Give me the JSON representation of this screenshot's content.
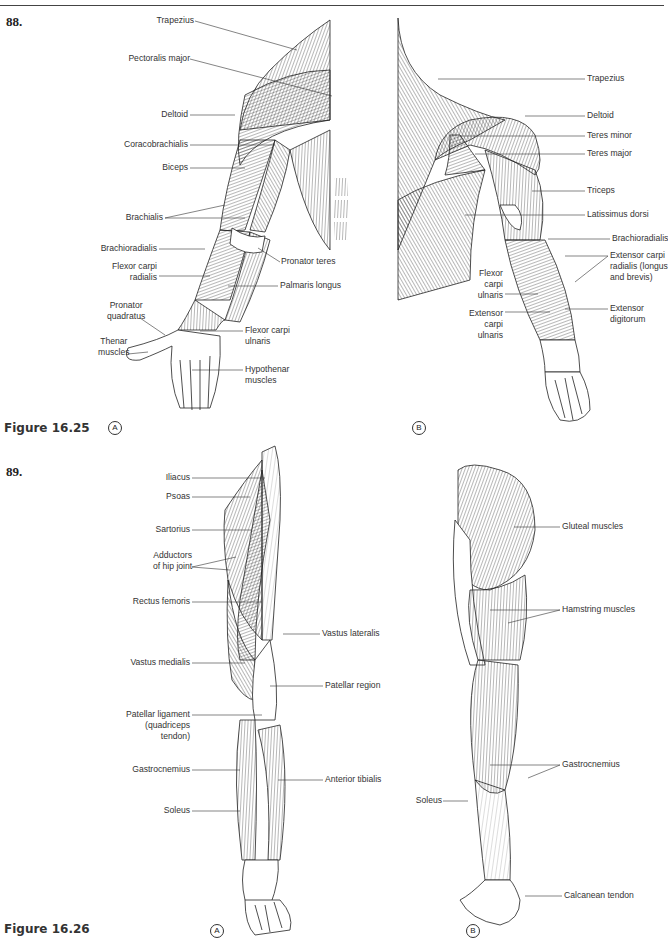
{
  "page": {
    "questions": [
      {
        "number": "88.",
        "figure": "Figure 16.25"
      },
      {
        "number": "89.",
        "figure": "Figure 16.26"
      }
    ]
  },
  "figure_16_25": {
    "caption": "Figure 16.25",
    "panel_a": {
      "marker": "A",
      "view": "anterior right arm",
      "labels": [
        "Trapezius",
        "Pectoralis major",
        "Deltoid",
        "Coracobrachialis",
        "Biceps",
        "Brachialis",
        "Brachioradialis",
        "Flexor carpi radialis",
        "Pronator teres",
        "Palmaris longus",
        "Pronator quadratus",
        "Thenar muscles",
        "Flexor carpi ulnaris",
        "Hypothenar muscles"
      ]
    },
    "panel_b": {
      "marker": "B",
      "view": "posterior right arm",
      "labels": [
        "Trapezius",
        "Deltoid",
        "Teres minor",
        "Teres major",
        "Triceps",
        "Latissimus dorsi",
        "Brachioradialis",
        "Extensor carpi radialis (longus and brevis)",
        "Flexor carpi ulnaris",
        "Extensor carpi ulnaris",
        "Extensor digitorum"
      ]
    }
  },
  "figure_16_26": {
    "caption": "Figure 16.26",
    "panel_a": {
      "marker": "A",
      "view": "anterior right leg",
      "labels": [
        "Iliacus",
        "Psoas",
        "Sartorius",
        "Adductors of hip joint",
        "Rectus femoris",
        "Vastus lateralis",
        "Vastus medialis",
        "Patellar region",
        "Patellar ligament (quadriceps tendon)",
        "Gastrocnemius",
        "Anterior tibialis",
        "Soleus"
      ]
    },
    "panel_b": {
      "marker": "B",
      "view": "posterior right leg",
      "labels": [
        "Gluteal muscles",
        "Hamstring muscles",
        "Gastrocnemius",
        "Soleus",
        "Calcanean tendon"
      ]
    }
  },
  "labels_text": {
    "a_trapezius": "Trapezius",
    "a_pectoralis": "Pectoralis major",
    "a_deltoid": "Deltoid",
    "a_coraco": "Coracobrachialis",
    "a_biceps": "Biceps",
    "a_brachialis": "Brachialis",
    "a_brachiorad": "Brachioradialis",
    "a_fcr1": "Flexor carpi",
    "a_fcr2": "radialis",
    "a_pronteres": "Pronator teres",
    "a_palmaris": "Palmaris longus",
    "a_pq1": "Pronator",
    "a_pq2": "quadratus",
    "a_thenar1": "Thenar",
    "a_thenar2": "muscles",
    "a_fcu1": "Flexor carpi",
    "a_fcu2": "ulnaris",
    "a_hypo1": "Hypothenar",
    "a_hypo2": "muscles",
    "b_trapezius": "Trapezius",
    "b_deltoid": "Deltoid",
    "b_teresmin": "Teres minor",
    "b_teresmaj": "Teres major",
    "b_triceps": "Triceps",
    "b_lat": "Latissimus dorsi",
    "b_brachiorad": "Brachioradialis",
    "b_ecr1": "Extensor carpi",
    "b_ecr2": "radialis (longus",
    "b_ecr3": "and brevis)",
    "b_fcu1": "Flexor",
    "b_fcu2": "carpi",
    "b_fcu3": "ulnaris",
    "b_ecu1": "Extensor",
    "b_ecu2": "carpi",
    "b_ecu3": "ulnaris",
    "b_ed1": "Extensor",
    "b_ed2": "digitorum",
    "l_iliacus": "Iliacus",
    "l_psoas": "Psoas",
    "l_sartorius": "Sartorius",
    "l_add1": "Adductors",
    "l_add2": "of hip joint",
    "l_rectus": "Rectus femoris",
    "l_vlat": "Vastus lateralis",
    "l_vmed": "Vastus medialis",
    "l_patreg": "Patellar region",
    "l_patlig1": "Patellar ligament",
    "l_patlig2": "(quadriceps",
    "l_patlig3": "tendon)",
    "l_gastroc": "Gastrocnemius",
    "l_anttib": "Anterior tibialis",
    "l_soleus": "Soleus",
    "p_gluteal": "Gluteal muscles",
    "p_hamstring": "Hamstring muscles",
    "p_gastroc": "Gastrocnemius",
    "p_soleus": "Soleus",
    "p_calcanean": "Calcanean tendon"
  },
  "markers": {
    "a": "A",
    "b": "B"
  },
  "numbers": {
    "q88": "88.",
    "q89": "89."
  },
  "captions": {
    "f1625": "Figure 16.25",
    "f1626": "Figure 16.26"
  }
}
